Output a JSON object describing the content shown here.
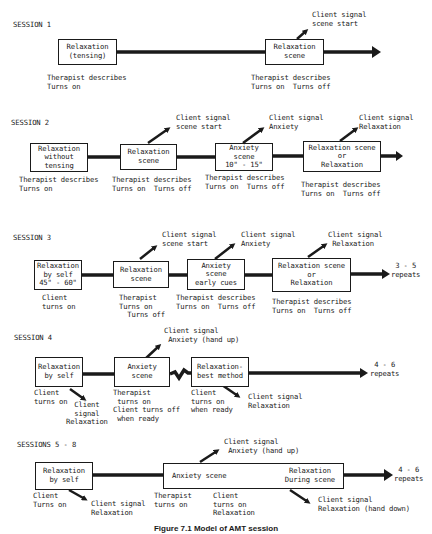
{
  "figure": {
    "caption": "Figure 7.1 Model of AMT session"
  },
  "sessions": [
    {
      "title": "SESSION 1",
      "boxes": [
        "Relaxation\n(tensing)",
        "Relaxation\nscene"
      ],
      "notes": [
        "Therapist describes\nTurns on",
        "Therapist describes\nTurns on  Turns off"
      ],
      "signals": [
        "Client signal\nscene start"
      ]
    },
    {
      "title": "SESSION 2",
      "boxes": [
        "Relaxation\nwithout\ntensing",
        "Relaxation\nscene",
        "Anxiety\nscene\n10\" - 15\"",
        "Relaxation scene\nor\nRelaxation"
      ],
      "notes": [
        "Therapist describes\nTurns on",
        "Therapist describes\nTurns on  Turns off",
        "Therapist describes\nTurns on  Turns off",
        "Therapist describes\nTurns on  Turns off"
      ],
      "signals": [
        "Client signal\nscene start",
        "Client signal\nAnxiety",
        "Client signal\nRelaxation"
      ]
    },
    {
      "title": "SESSION 3",
      "boxes": [
        "Relaxation\nby self\n45\" - 60\"",
        "Relaxation\nscene",
        "Anxiety\nscene\nearly cues",
        "Relaxation scene\nor\nRelaxation"
      ],
      "notes": [
        "Client\nturns on",
        "Therapist\nTurns on\n  Turns off",
        "Therapist describes\nTurns on  Turns off",
        "Therapist describes\nTurns on  Turns off"
      ],
      "signals": [
        "Client signal\nscene start",
        "Client signal\nAnxiety",
        "Client signal\n Relaxation"
      ],
      "repeats": "3 - 5\nrepeats"
    },
    {
      "title": "SESSION 4",
      "boxes": [
        "Relaxation\nby self",
        "Anxiety\nscene",
        "Relaxation-\nbest method"
      ],
      "notes": [
        "Client\nturns on",
        "Therapist\n turns on\nClient turns off\n when ready",
        "Client\nturns on\nwhen ready"
      ],
      "signals": [
        "  Client\n  signal\nRelaxation",
        "Client signal\n Anxiety (hand up)",
        "Client signal\nRelaxation"
      ],
      "repeats": "4 - 6\nrepeats"
    },
    {
      "title": "SESSIONS 5 - 8",
      "boxes": [
        "Relaxation\nby self",
        "Anxiety scene",
        "Relaxation\nDuring scene"
      ],
      "notes": [
        "Client\nTurns on",
        "Therapist\nturns on",
        "Client\nturns on\nRelaxation"
      ],
      "signals": [
        "Client signal\nRelaxation",
        "Client signal\n Anxiety (hand up)",
        "Client signal\nRelaxation (hand down)"
      ],
      "repeats": "4 - 6\nrepeats"
    }
  ]
}
